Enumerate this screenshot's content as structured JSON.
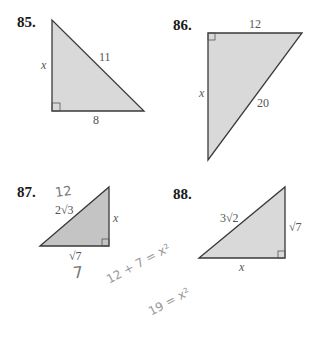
{
  "problems": [
    {
      "number": "85.",
      "sides": {
        "leg_vertical": "x",
        "hypotenuse": "11",
        "leg_horizontal": "8"
      }
    },
    {
      "number": "86.",
      "sides": {
        "leg_horizontal": "12",
        "leg_vertical": "x",
        "hypotenuse": "20"
      }
    },
    {
      "number": "87.",
      "sides": {
        "hypotenuse": "2√3",
        "leg_vertical": "x",
        "leg_horizontal": "√7"
      }
    },
    {
      "number": "88.",
      "sides": {
        "hypotenuse": "3√2",
        "leg_vertical": "√7",
        "leg_horizontal": "x"
      }
    }
  ],
  "handwriting": {
    "above_87_hypotenuse": "12",
    "below_87_base": "7",
    "equation_1": "12 + 7 = x²",
    "equation_2": "19 = x²"
  },
  "colors": {
    "triangle_fill": "#d9d9d9",
    "triangle_stroke": "#3a3a3a",
    "label": "#555555"
  }
}
